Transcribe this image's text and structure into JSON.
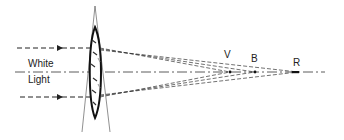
{
  "diagram": {
    "labels": {
      "input_line1": "White",
      "input_line2": "Light",
      "violet_focus": "V",
      "blue_focus": "B",
      "red_focus": "R"
    },
    "focal_points": [
      {
        "name": "V",
        "meaning": "violet focus",
        "x": 230
      },
      {
        "name": "B",
        "meaning": "blue focus",
        "x": 255
      },
      {
        "name": "R",
        "meaning": "red focus",
        "x": 298
      }
    ],
    "colors": {
      "ink": "#222222",
      "background": "#ffffff"
    }
  }
}
